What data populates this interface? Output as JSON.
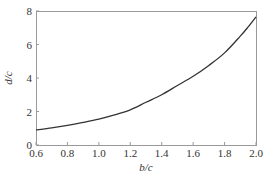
{
  "chart_data": {
    "type": "line",
    "title": "",
    "xlabel": "b/c",
    "ylabel": "d/c",
    "xlim": [
      0.6,
      2.0
    ],
    "ylim": [
      0,
      8
    ],
    "grid": false,
    "legend": null,
    "xticks": [
      0.6,
      0.8,
      1.0,
      1.2,
      1.4,
      1.6,
      1.8,
      2.0
    ],
    "xtick_labels": [
      "0.6",
      "0.8",
      "1.0",
      "1.2",
      "1.4",
      "1.6",
      "1.8",
      "2.0"
    ],
    "yticks": [
      0,
      2,
      4,
      6,
      8
    ],
    "ytick_labels": [
      "0",
      "2",
      "4",
      "6",
      "8"
    ],
    "series": [
      {
        "name": "d/c",
        "color": "#333333",
        "x": [
          0.6,
          0.7,
          0.8,
          0.9,
          1.0,
          1.1,
          1.2,
          1.3,
          1.4,
          1.5,
          1.6,
          1.7,
          1.8,
          1.9,
          1.95,
          2.0
        ],
        "y": [
          0.9,
          1.02,
          1.17,
          1.35,
          1.55,
          1.8,
          2.1,
          2.55,
          3.0,
          3.55,
          4.1,
          4.75,
          5.5,
          6.5,
          7.05,
          7.65
        ]
      }
    ]
  },
  "layout": {
    "plot_left": 36,
    "plot_right": 256,
    "plot_top": 11,
    "plot_bottom": 145
  }
}
